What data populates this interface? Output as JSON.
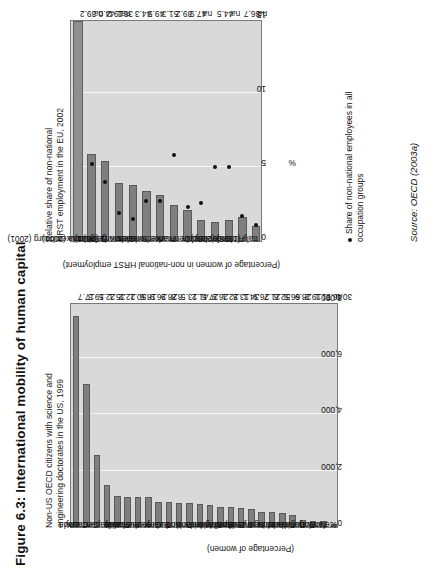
{
  "figure": {
    "title": "Figure 6.3: International mobility of human capital",
    "source": "Source: OECD (2003a)"
  },
  "chart_data": [
    {
      "id": "left",
      "type": "bar",
      "title": "Non-US OECD citizens with science and\nengineering doctorates in the US, 1999",
      "xlabel": "",
      "ylabel": "(Percentage of women)",
      "xlim": [
        0,
        8000
      ],
      "xticks": [
        "0",
        "2,000",
        "4,000",
        "6,000",
        "8,000"
      ],
      "grid": true,
      "orientation": "horizontal",
      "categories": [
        "UK",
        "Canada",
        "Germany",
        "Japan",
        "Italy",
        "France",
        "Australia",
        "Netherlands",
        "Greece",
        "Turkey",
        "Korea",
        "Poland",
        "Ireland",
        "Mexico",
        "Belgium",
        "Spain",
        "Switzerland",
        "Sweden",
        "New Zealand",
        "Hungary",
        "Austria",
        "Finland",
        "Denmark",
        "Portugal",
        "Norway",
        "Iceland"
      ],
      "values": [
        7500,
        5100,
        2550,
        1500,
        1100,
        1080,
        1060,
        1060,
        900,
        880,
        860,
        840,
        800,
        790,
        720,
        700,
        690,
        640,
        540,
        520,
        500,
        420,
        250,
        220,
        210,
        120
      ],
      "data_labels": [
        "17.7",
        "19.3",
        "22.5",
        "35.1",
        "22.2",
        "50.1",
        "18.6",
        "26.9",
        "28.9",
        "8.8",
        "13.5",
        "41.2",
        "27.5",
        "26.9",
        "22.1",
        "13.5",
        "34.1",
        "26.9",
        "21.7",
        "52.6",
        "66.5",
        "28.9",
        "19.2",
        "71.1",
        "46.6",
        "30.0"
      ]
    },
    {
      "id": "right",
      "type": "bar",
      "title": "Relative share of non-national\nHRST employment in the EU, 2002",
      "xlabel": "%",
      "ylabel": "(Percentage of women in non-national HRST employment)",
      "xlim": [
        0,
        15
      ],
      "xticks": [
        "0",
        "5",
        "10",
        "15"
      ],
      "grid": true,
      "orientation": "horizontal",
      "categories": [
        "Luxembourg (2001)",
        "Austria (2001)",
        "Belgium",
        "UK (1998)",
        "Germany (2001)",
        "Sweden",
        "Netherlands",
        "France",
        "Denmark",
        "Spain",
        "Ireland",
        "Greece",
        "Finland (2001)",
        "Italy (1998)"
      ],
      "values": [
        14.6,
        5.9,
        5.4,
        3.9,
        3.8,
        3.4,
        3.1,
        2.4,
        2.1,
        1.4,
        1.3,
        1.4,
        1.6,
        1.0
      ],
      "series": [
        {
          "name": "Share of non-national employees in all occupation groups",
          "type": "scatter",
          "values": [
            9.8,
            5.2,
            4.0,
            1.9,
            1.5,
            2.7,
            2.7,
            5.8,
            2.3,
            2.6,
            5.0,
            5.0,
            1.7,
            1.1
          ]
        }
      ],
      "data_labels": [
        "38.1 44.0 39.2",
        "na",
        "19.2",
        "na",
        "44.3",
        "49.5",
        "51.3",
        "39.2",
        "47.9",
        "na",
        "44.5",
        "na",
        "36.7",
        "na"
      ],
      "legend": {
        "position": "bottom-right",
        "entries": [
          "Share of non-national employees in all\noccupation groups"
        ]
      }
    }
  ]
}
